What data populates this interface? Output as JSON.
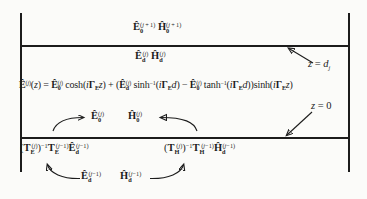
{
  "colors": {
    "background": "#fbfbf9",
    "ink": "#1c1c1c"
  },
  "diagram": {
    "upper_region_fields": "\\B{Ê}_{\\B{0}}^{(\\I{j} + 1)} \\B{Ĥ}_{\\B{0}}^{(\\I{j} + 1)}",
    "layer_top_fields": "\\B{Ê}_{\\B{d}}^{(\\I{j})} \\B{Ĥ}_{\\B{d}}^{(\\I{j})}",
    "top_interface_label": "\\I{z} = \\I{d}_{\\I{j}}",
    "field_equation": "\\B{Ê}^{(\\I{j})}(\\I{z}) = \\B{Ê}_{\\B{0}}^{(\\I{j})} cosh(\\I{i}\\B{Γ}_{\\B{E}}\\I{z}) + (\\B{Ê}_{\\B{d}}^{(\\I{j})} sinh^{−1}(\\I{i}\\B{Γ}_{\\B{E}}\\I{d}) − \\B{Ê}_{\\B{0}}^{(\\I{j})} tanh^{−1}(\\I{i}\\B{Γ}_{\\B{E}}\\I{d}))sinh(\\I{i}\\B{Γ}_{\\B{E}}\\I{z})",
    "bottom_interface_label": "\\I{z} = 0",
    "e0_field": "\\B{Ê}_{\\B{0}}^{(\\I{j})}",
    "h0_field": "\\B{Ĥ}_{\\B{0}}^{(\\I{j})}",
    "te_transfer_expression": "(\\B{T}_{\\B{E}}^{(\\I{j})})^{−1}\\B{T}_{\\B{E}}^{(\\I{j}−1)}\\B{Ê}_{\\B{d}}^{(\\I{j}−1)}",
    "th_transfer_expression": "(\\B{T}_{\\B{H}}^{(\\I{j})})^{−1}\\B{T}_{\\B{H}}^{(\\I{j}−1)}\\B{Ĥ}_{\\B{d}}^{(\\I{j}−1)}",
    "ed_previous_layer": "\\B{Ê}_{\\B{d}}^{(\\I{j}−1)}",
    "hd_previous_layer": "\\B{Ĥ}_{\\B{d}}^{(\\I{j}−1)}"
  }
}
